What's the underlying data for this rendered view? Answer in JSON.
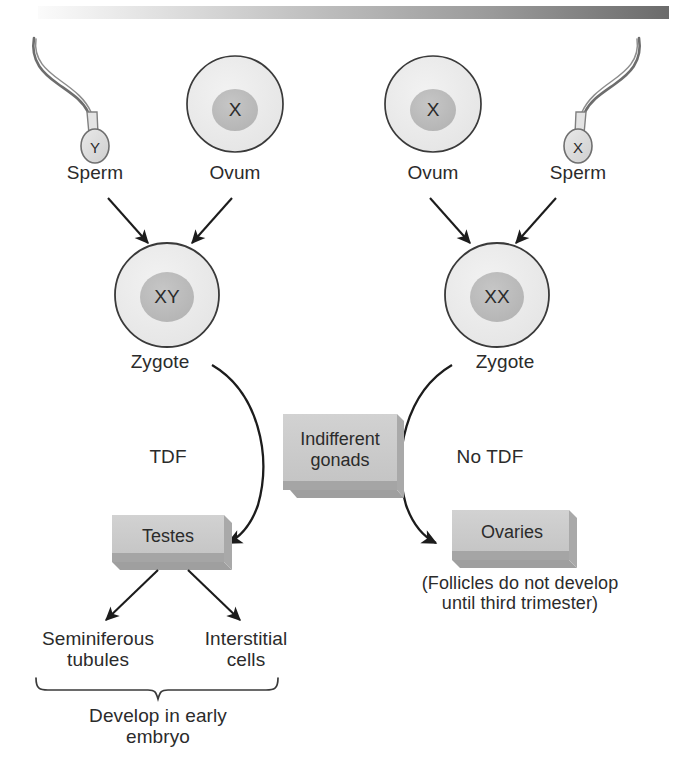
{
  "figure": {
    "background": "#ffffff",
    "ink": "#2b2b2b"
  },
  "top_bar": {
    "name": "header-gradient-bar",
    "from_color": "#f2f2f2",
    "to_color": "#6f6f6f"
  },
  "palette": {
    "cell_fill": "#ebebeb",
    "nucleus_fill": "#bcbcbc",
    "box_face": "#c9c9c9",
    "box_edge": "#8e8e8e",
    "outline": "#2b2b2b"
  },
  "gametes": [
    {
      "id": "sperm-y",
      "type": "sperm",
      "label": "Sperm",
      "chromosome": "Y",
      "side": "left"
    },
    {
      "id": "ovum-left",
      "type": "ovum",
      "label": "Ovum",
      "chromosome": "X",
      "side": "left"
    },
    {
      "id": "ovum-right",
      "type": "ovum",
      "label": "Ovum",
      "chromosome": "X",
      "side": "right"
    },
    {
      "id": "sperm-x",
      "type": "sperm",
      "label": "Sperm",
      "chromosome": "X",
      "side": "right"
    }
  ],
  "zygotes": [
    {
      "id": "zygote-xy",
      "label": "Zygote",
      "chromosome": "XY",
      "side": "left"
    },
    {
      "id": "zygote-xx",
      "label": "Zygote",
      "chromosome": "XX",
      "side": "right"
    }
  ],
  "boxes": [
    {
      "id": "indifferent-gonads",
      "label": "Indifferent\ngonads"
    },
    {
      "id": "testes",
      "label": "Testes"
    },
    {
      "id": "ovaries",
      "label": "Ovaries"
    }
  ],
  "pathway_labels": [
    {
      "id": "tdf",
      "label": "TDF",
      "side": "left"
    },
    {
      "id": "no-tdf",
      "label": "No TDF",
      "side": "right"
    }
  ],
  "testes_derivatives": [
    {
      "id": "seminiferous-tubules",
      "label": "Seminiferous\ntubules"
    },
    {
      "id": "interstitial-cells",
      "label": "Interstitial\ncells"
    }
  ],
  "annotations": [
    {
      "id": "brace-caption",
      "label": "Develop in early\nembryo"
    },
    {
      "id": "ovaries-note",
      "label": "(Follicles do not develop\nuntil third trimester)"
    }
  ]
}
